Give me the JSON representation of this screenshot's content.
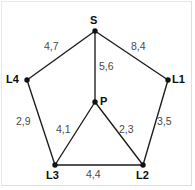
{
  "figure": {
    "background_color": "#ffffff",
    "edge_color": "#1b1b1b",
    "vertex_color": "#111111",
    "vertex_label_color": "#0d0d0d",
    "weight_label_color": "#4a4a4a",
    "border_color": "#e9e9e9"
  },
  "chart_data": {
    "type": "diagram",
    "title": "",
    "nodes": [
      {
        "id": "S",
        "label": "S",
        "x": 95,
        "y": 31,
        "label_x": 90,
        "label_y": 15
      },
      {
        "id": "L1",
        "label": "L1",
        "x": 168,
        "y": 80,
        "label_x": 172,
        "label_y": 74
      },
      {
        "id": "L2",
        "label": "L2",
        "x": 143,
        "y": 165,
        "label_x": 136,
        "label_y": 170
      },
      {
        "id": "L3",
        "label": "L3",
        "x": 55,
        "y": 165,
        "label_x": 46,
        "label_y": 170
      },
      {
        "id": "L4",
        "label": "L4",
        "x": 27,
        "y": 80,
        "label_x": 6,
        "label_y": 74
      },
      {
        "id": "P",
        "label": "P",
        "x": 95,
        "y": 102,
        "label_x": 100,
        "label_y": 96
      }
    ],
    "edges": [
      {
        "from": "S",
        "to": "L4",
        "weight": "4,7",
        "label_x": 44,
        "label_y": 41
      },
      {
        "from": "S",
        "to": "L1",
        "weight": "8,4",
        "label_x": 131,
        "label_y": 41
      },
      {
        "from": "S",
        "to": "P",
        "weight": "5,6",
        "label_x": 99,
        "label_y": 61
      },
      {
        "from": "L4",
        "to": "L3",
        "weight": "2,9",
        "label_x": 16,
        "label_y": 116
      },
      {
        "from": "L1",
        "to": "L2",
        "weight": "3,5",
        "label_x": 157,
        "label_y": 116
      },
      {
        "from": "P",
        "to": "L3",
        "weight": "4,1",
        "label_x": 56,
        "label_y": 124
      },
      {
        "from": "P",
        "to": "L2",
        "weight": "2,3",
        "label_x": 119,
        "label_y": 124
      },
      {
        "from": "L3",
        "to": "L2",
        "weight": "4,4",
        "label_x": 86,
        "label_y": 169
      }
    ]
  }
}
